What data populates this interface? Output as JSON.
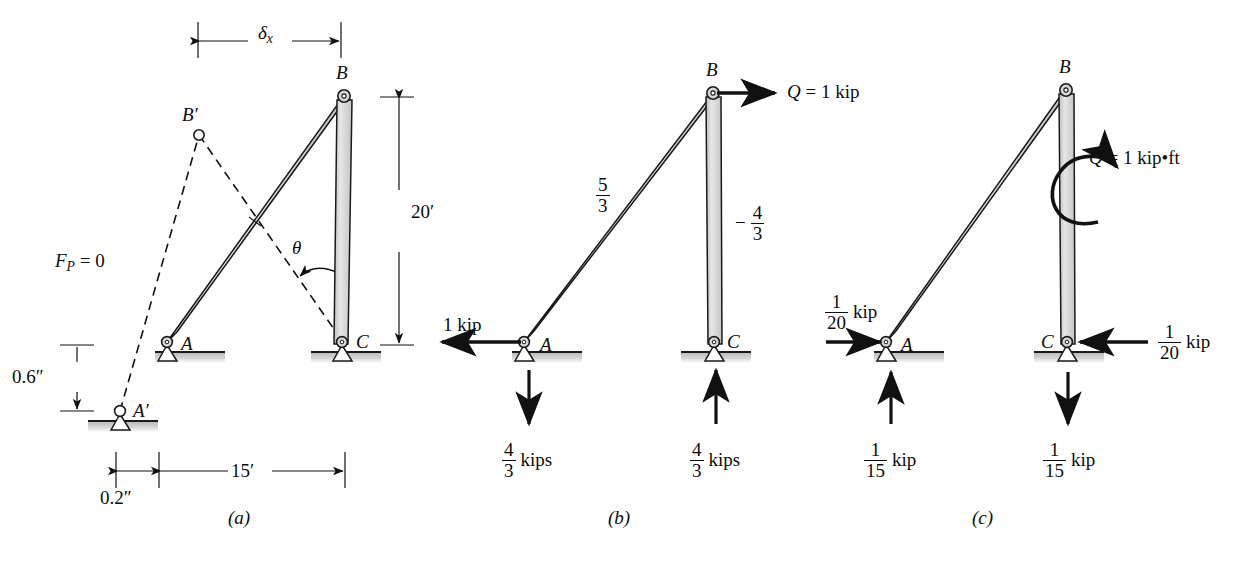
{
  "figure": {
    "kind": "structural-engineering-truss-diagram",
    "panels": [
      {
        "id": "a",
        "caption": "(a)",
        "joint_labels": [
          "B",
          "B′",
          "A",
          "A′",
          "C"
        ],
        "annotations": {
          "delta_x": "δ",
          "delta_x_sub": "x",
          "force_p_label": "F",
          "force_p_sub": "P",
          "force_p_value": " = 0",
          "theta": "θ",
          "height_20": "20′",
          "span_15": "15′",
          "vert_offset": "0.6″",
          "horiz_offset": "0.2″"
        }
      },
      {
        "id": "b",
        "caption": "(b)",
        "joint_labels": [
          "B",
          "A",
          "C"
        ],
        "applied_load": "Q = 1 kip",
        "member_forces": [
          {
            "member": "AB",
            "num": "5",
            "den": "3",
            "sign": ""
          },
          {
            "member": "BC",
            "num": "4",
            "den": "3",
            "sign": "−"
          }
        ],
        "reactions": [
          {
            "at": "A",
            "num": "1",
            "den": "",
            "whole": "1 kip",
            "dir": "left"
          },
          {
            "at": "A",
            "num": "4",
            "den": "3",
            "unit": "kips",
            "dir": "down"
          },
          {
            "at": "C",
            "num": "4",
            "den": "3",
            "unit": "kips",
            "dir": "up"
          }
        ]
      },
      {
        "id": "c",
        "caption": "(c)",
        "joint_labels": [
          "B",
          "A",
          "C"
        ],
        "applied_load": "Q = 1 kip•ft",
        "applied_load_sym": "Q",
        "applied_load_rest": " = 1 kip•ft",
        "reactions": [
          {
            "at": "A",
            "num": "1",
            "den": "20",
            "unit": "kip",
            "dir": "right"
          },
          {
            "at": "A",
            "num": "1",
            "den": "15",
            "unit": "kip",
            "dir": "up"
          },
          {
            "at": "C",
            "num": "1",
            "den": "20",
            "unit": "kip",
            "dir": "left"
          },
          {
            "at": "C",
            "num": "1",
            "den": "15",
            "unit": "kip",
            "dir": "down"
          }
        ]
      }
    ],
    "colors": {
      "member_fill": "#cfcfcf",
      "member_fill_light": "#e2e2e2",
      "outline": "#1a1a1a",
      "ground": "#c9c9c9",
      "text": "#0d0d0d",
      "background": "#ffffff"
    },
    "units": {
      "kip": "kip",
      "kips": "kips",
      "kipft": "kip•ft",
      "feet": "′",
      "inches": "″"
    }
  }
}
